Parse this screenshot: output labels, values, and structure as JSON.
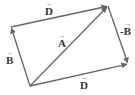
{
  "diagram": {
    "type": "vector-parallelogram",
    "colors": {
      "line": "#666666",
      "text": "#333333",
      "background": "#ffffff"
    },
    "points": {
      "origin": [
        30,
        86
      ],
      "b_tip": [
        11,
        27
      ],
      "a_tip": [
        108,
        6
      ],
      "d_low_tip": [
        128,
        64
      ]
    },
    "vectors": [
      {
        "id": "B",
        "from": "origin",
        "to": "b_tip",
        "label": "B"
      },
      {
        "id": "D_top",
        "from": "b_tip",
        "to": "a_tip",
        "label": "D"
      },
      {
        "id": "A",
        "from": "origin",
        "to": "a_tip",
        "label": "A"
      },
      {
        "id": "neg_B",
        "from": "a_tip",
        "to": "d_low_tip",
        "label": "-B"
      },
      {
        "id": "D_bottom",
        "from": "origin",
        "to": "d_low_tip",
        "label": "D"
      }
    ],
    "labels": {
      "d_top": {
        "text": "D",
        "arrow": "→"
      },
      "a": {
        "text": "A",
        "arrow": "→"
      },
      "b": {
        "text": "B",
        "arrow": "→"
      },
      "neg_b": {
        "text": "-B",
        "arrow": "→"
      },
      "d_bottom": {
        "text": "D",
        "arrow": "→"
      }
    }
  }
}
